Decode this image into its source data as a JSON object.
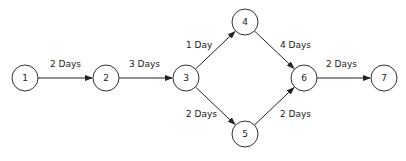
{
  "diagram": {
    "type": "network-diagram",
    "nodes": [
      {
        "id": "1",
        "label": "1",
        "x": 25,
        "y": 78
      },
      {
        "id": "2",
        "label": "2",
        "x": 106,
        "y": 78
      },
      {
        "id": "3",
        "label": "3",
        "x": 186,
        "y": 78
      },
      {
        "id": "4",
        "label": "4",
        "x": 245,
        "y": 22
      },
      {
        "id": "5",
        "label": "5",
        "x": 245,
        "y": 134
      },
      {
        "id": "6",
        "label": "6",
        "x": 304,
        "y": 78
      },
      {
        "id": "7",
        "label": "7",
        "x": 384,
        "y": 78
      }
    ],
    "edges": [
      {
        "from": "1",
        "to": "2",
        "label": "2 Days",
        "lx": 50,
        "ly": 67
      },
      {
        "from": "2",
        "to": "3",
        "label": "3 Days",
        "lx": 129,
        "ly": 67
      },
      {
        "from": "3",
        "to": "4",
        "label": "1 Day",
        "lx": 186,
        "ly": 48
      },
      {
        "from": "3",
        "to": "5",
        "label": "2 Days",
        "lx": 186,
        "ly": 117
      },
      {
        "from": "4",
        "to": "6",
        "label": "4 Days",
        "lx": 280,
        "ly": 48
      },
      {
        "from": "5",
        "to": "6",
        "label": "2 Days",
        "lx": 280,
        "ly": 117
      },
      {
        "from": "6",
        "to": "7",
        "label": "2 Days",
        "lx": 326,
        "ly": 67
      }
    ]
  },
  "style": {
    "node_radius": 13,
    "line_color": "#222222",
    "node_stroke": "#333333",
    "background": "#ffffff"
  }
}
